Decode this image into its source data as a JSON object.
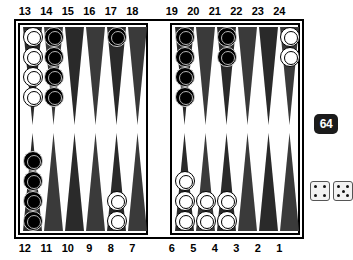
{
  "board": {
    "top_labels": [
      "13",
      "14",
      "15",
      "16",
      "17",
      "18",
      "19",
      "20",
      "21",
      "22",
      "23",
      "24"
    ],
    "bottom_labels": [
      "12",
      "11",
      "10",
      "9",
      "8",
      "7",
      "6",
      "5",
      "4",
      "3",
      "2",
      "1"
    ],
    "points": {
      "13": {
        "color": "white",
        "count": 4
      },
      "14": {
        "color": "black",
        "count": 4
      },
      "15": {
        "color": "none",
        "count": 0
      },
      "16": {
        "color": "none",
        "count": 0
      },
      "17": {
        "color": "black",
        "count": 1
      },
      "18": {
        "color": "none",
        "count": 0
      },
      "19": {
        "color": "black",
        "count": 4
      },
      "20": {
        "color": "none",
        "count": 0
      },
      "21": {
        "color": "black",
        "count": 2
      },
      "22": {
        "color": "none",
        "count": 0
      },
      "23": {
        "color": "none",
        "count": 0
      },
      "24": {
        "color": "white",
        "count": 2
      },
      "12": {
        "color": "black",
        "count": 4
      },
      "11": {
        "color": "none",
        "count": 0
      },
      "10": {
        "color": "none",
        "count": 0
      },
      "9": {
        "color": "none",
        "count": 0
      },
      "8": {
        "color": "white",
        "count": 2
      },
      "7": {
        "color": "none",
        "count": 0
      },
      "6": {
        "color": "white",
        "count": 3
      },
      "5": {
        "color": "white",
        "count": 2
      },
      "4": {
        "color": "white",
        "count": 2
      },
      "3": {
        "color": "none",
        "count": 0
      },
      "2": {
        "color": "none",
        "count": 0
      },
      "1": {
        "color": "none",
        "count": 0
      }
    },
    "bar": {
      "white": 0,
      "black": 0
    }
  },
  "side_panel": {
    "doubling_cube": {
      "value": "64"
    },
    "dice": [
      {
        "value": 4,
        "pips": [
          "p-tl",
          "p-tr",
          "p-bl",
          "p-br"
        ]
      },
      {
        "value": 5,
        "pips": [
          "p-tl",
          "p-tr",
          "p-c",
          "p-bl",
          "p-br"
        ]
      }
    ]
  },
  "colors": {
    "board_background": "#ffffff",
    "frame": "#000000",
    "point_dark": "#2a2a2a",
    "checker_white": "#ffffff",
    "checker_black": "#000000",
    "cube_background": "#1b1b1b",
    "cube_text": "#ffffff"
  }
}
